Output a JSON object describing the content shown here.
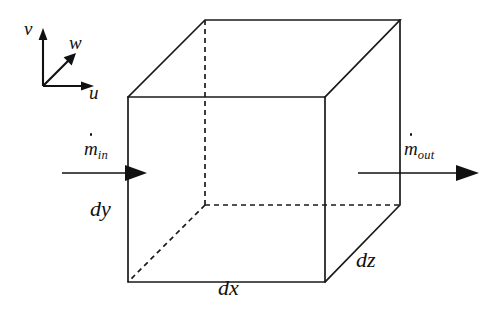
{
  "figure": {
    "background_color": "#ffffff",
    "line_color": "#1a1a1a"
  },
  "axes": {
    "origin": [
      43,
      86
    ],
    "items": [
      {
        "name": "v-axis",
        "label": "v",
        "direction": "up",
        "tip": [
          43,
          30
        ]
      },
      {
        "name": "w-axis",
        "label": "w",
        "direction": "up-right-diagonal",
        "tip": [
          74,
          54
        ]
      },
      {
        "name": "u-axis",
        "label": "u",
        "direction": "right",
        "tip": [
          94,
          86
        ]
      }
    ]
  },
  "cube": {
    "front_top_left": [
      128,
      97
    ],
    "front_top_right": [
      325,
      97
    ],
    "front_bottom_left": [
      128,
      282
    ],
    "front_bottom_right": [
      325,
      282
    ],
    "back_top_left": [
      205,
      20
    ],
    "back_top_right": [
      400,
      20
    ],
    "back_bottom_left": [
      205,
      205
    ],
    "back_bottom_right": [
      400,
      205
    ],
    "hidden_edges": [
      "back-bottom-left vertical",
      "back-bottom-left to front-bottom-left",
      "back-bottom-left to back-bottom-right"
    ]
  },
  "dimensions": [
    {
      "name": "dx",
      "label": "dx",
      "edge": "front-bottom horizontal"
    },
    {
      "name": "dy",
      "label": "dy",
      "edge": "front-left vertical"
    },
    {
      "name": "dz",
      "label": "dz",
      "edge": "bottom-right diagonal depth"
    }
  ],
  "flows": {
    "inlet": {
      "label_base": "m",
      "label_sub": "in",
      "has_dot": true,
      "arrow_from": [
        62,
        173
      ],
      "arrow_to": [
        146,
        173
      ]
    },
    "outlet": {
      "label_base": "m",
      "label_sub": "out",
      "has_dot": true,
      "arrow_from": [
        358,
        173
      ],
      "arrow_to": [
        479,
        173
      ]
    }
  }
}
